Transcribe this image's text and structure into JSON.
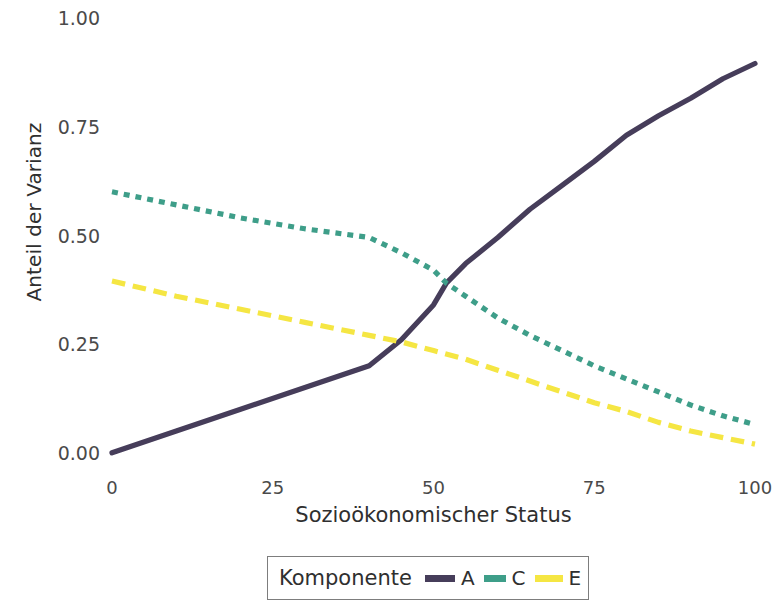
{
  "chart_data": {
    "type": "line",
    "title": "",
    "xlabel": "Sozioökonomischer Status",
    "ylabel": "Anteil der Varianz",
    "xlim": [
      0,
      100
    ],
    "ylim": [
      0,
      1
    ],
    "xticks": [
      0,
      25,
      50,
      75,
      100
    ],
    "xticklabels": [
      "0",
      "25",
      "50",
      "75",
      "100"
    ],
    "yticks": [
      0.0,
      0.25,
      0.5,
      0.75,
      1.0
    ],
    "yticklabels": [
      "0.00",
      "0.25",
      "0.50",
      "0.75",
      "1.00"
    ],
    "grid": false,
    "legend_position": "bottom",
    "legend_title": "Komponente",
    "series": [
      {
        "name": "A",
        "color": "#463D5A",
        "dash": "solid",
        "x": [
          0,
          10,
          20,
          30,
          40,
          45,
          50,
          52,
          55,
          60,
          65,
          70,
          75,
          80,
          85,
          90,
          95,
          100
        ],
        "values": [
          0.005,
          0.055,
          0.105,
          0.155,
          0.205,
          0.265,
          0.345,
          0.395,
          0.44,
          0.5,
          0.565,
          0.62,
          0.675,
          0.735,
          0.78,
          0.82,
          0.865,
          0.9
        ]
      },
      {
        "name": "C",
        "color": "#3E9E89",
        "dash": "short-dash",
        "x": [
          0,
          10,
          20,
          30,
          40,
          45,
          50,
          52,
          55,
          60,
          65,
          70,
          75,
          80,
          85,
          90,
          95,
          100
        ],
        "values": [
          0.605,
          0.575,
          0.545,
          0.52,
          0.5,
          0.465,
          0.425,
          0.395,
          0.365,
          0.315,
          0.275,
          0.24,
          0.205,
          0.175,
          0.145,
          0.115,
          0.09,
          0.07
        ]
      },
      {
        "name": "E",
        "color": "#F5E643",
        "dash": "long-dash",
        "x": [
          0,
          10,
          20,
          30,
          40,
          45,
          50,
          55,
          60,
          65,
          70,
          75,
          80,
          85,
          90,
          95,
          100
        ],
        "values": [
          0.4,
          0.365,
          0.335,
          0.305,
          0.275,
          0.26,
          0.24,
          0.22,
          0.195,
          0.17,
          0.145,
          0.12,
          0.1,
          0.075,
          0.055,
          0.04,
          0.025
        ]
      }
    ]
  },
  "axes": {
    "y_title": "Anteil der Varianz",
    "x_title": "Sozioökonomischer Status"
  },
  "legend": {
    "title": "Komponente",
    "entries": [
      {
        "label": "A",
        "color": "#463D5A"
      },
      {
        "label": "C",
        "color": "#3E9E89"
      },
      {
        "label": "E",
        "color": "#F5E643"
      }
    ]
  }
}
